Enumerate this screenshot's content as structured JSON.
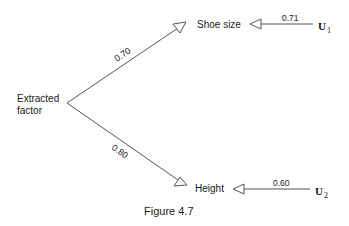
{
  "figure": {
    "caption": "Figure 4.7",
    "factor": {
      "line1": "Extracted",
      "line2": "factor"
    },
    "variables": [
      {
        "name": "Shoe size",
        "loading": "0.70",
        "error_label": "U",
        "error_sub": "1",
        "error_path": "0.71"
      },
      {
        "name": "Height",
        "loading": "0.80",
        "error_label": "U",
        "error_sub": "2",
        "error_path": "0.60"
      }
    ],
    "colors": {
      "line": "#555555",
      "text": "#1a1a1a",
      "background": "#ffffff"
    }
  }
}
